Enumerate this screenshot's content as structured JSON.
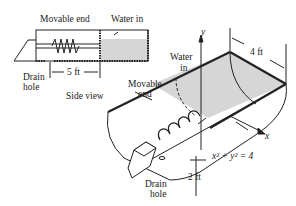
{
  "side_view": {
    "movable_end_label": "Movable end",
    "water_in_label": "Water in",
    "drain_line1": "Drain",
    "drain_line2": "hole",
    "length_label": "5 ft",
    "caption": "Side view"
  },
  "perspective_view": {
    "y_axis_label": "y",
    "x_axis_label": "x",
    "width_label": "4 ft",
    "water_line1": "Water",
    "water_line2": "in",
    "movable_line1": "Movable",
    "movable_line2": "end",
    "equation": "x² + y² = 4",
    "depth_label": "2 ft",
    "drain_line1": "Drain",
    "drain_line2": "hole"
  },
  "colors": {
    "line": "#222222",
    "water": "#d6d6d6",
    "background": "#ffffff"
  }
}
